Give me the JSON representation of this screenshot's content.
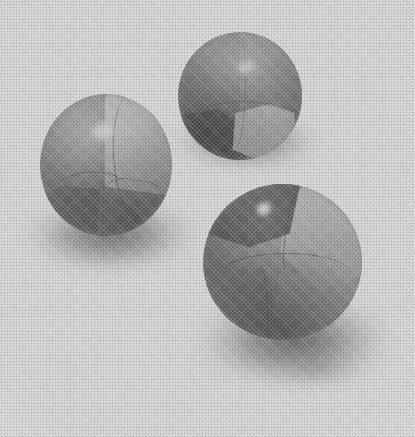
{
  "image": {
    "subject": "Three juggling balls",
    "medium": "Halftone-printed grayscale photograph",
    "background_color": "#ffffff",
    "object_count": 3,
    "alt_text": "Three round stitched-panel juggling balls on a white surface with soft shadows"
  },
  "palette": {
    "background": "#ffffff",
    "panel_light": "#d6d6d6",
    "panel_white": "#eeeeee",
    "panel_medium": "#9a9a9a",
    "panel_dark": "#6c6c6c",
    "panel_darkest": "#565656",
    "seam": "#5e5e5e",
    "highlight": "#ffffff",
    "shadow": "#6e6e6e"
  },
  "balls": [
    {
      "id": "ball-left",
      "label": "left-ball",
      "position": "left",
      "bounds": {
        "x": 40,
        "y": 94,
        "width": 132,
        "height": 142
      },
      "panels": [
        {
          "name": "upper-left-main",
          "tone": "medium",
          "color": "#a4a4a4"
        },
        {
          "name": "right-light",
          "tone": "light",
          "color": "#d2d2d2"
        },
        {
          "name": "lower-left-wedge",
          "tone": "dark",
          "color": "#7c7c7c"
        },
        {
          "name": "lower-right-foot",
          "tone": "dark",
          "color": "#868686"
        }
      ],
      "seams": [
        "vertical-curved",
        "lower-diagonal",
        "foot-diagonal"
      ],
      "highlight": {
        "name": "specular-highlight",
        "x": 36,
        "y": 18
      }
    },
    {
      "id": "ball-top",
      "label": "top-ball",
      "position": "top-center",
      "bounds": {
        "x": 178,
        "y": 32,
        "width": 124,
        "height": 128
      },
      "panels": [
        {
          "name": "upper-left-main",
          "tone": "medium-dark",
          "color": "#9c9c9c"
        },
        {
          "name": "upper-right",
          "tone": "medium",
          "color": "#a6a6a6"
        },
        {
          "name": "lower-right-white",
          "tone": "white",
          "color": "#e4e4e4"
        },
        {
          "name": "lower-left-shaded",
          "tone": "dark",
          "color": "#6d6d6d"
        }
      ],
      "seams": [
        "vertical-stitched",
        "horizontal-curved"
      ],
      "highlight": {
        "name": "specular-highlight",
        "x": 45,
        "y": 20
      }
    },
    {
      "id": "ball-right",
      "label": "bottom-right-ball",
      "position": "bottom-right",
      "bounds": {
        "x": 203,
        "y": 184,
        "width": 159,
        "height": 156
      },
      "panels": [
        {
          "name": "upper-left-dark",
          "tone": "darkest",
          "color": "#636363"
        },
        {
          "name": "upper-right-light",
          "tone": "light",
          "color": "#c9c9c9"
        },
        {
          "name": "lower-left-medium",
          "tone": "medium",
          "color": "#8a8a8a"
        },
        {
          "name": "lower-right-medium-light",
          "tone": "medium-light",
          "color": "#a2a2a2"
        }
      ],
      "seams": [
        "vertical-curved",
        "horizontal-curved",
        "lower-vertical"
      ],
      "highlight": {
        "name": "specular-highlight",
        "x": 32,
        "y": 10
      }
    }
  ],
  "shadows": [
    {
      "id": "shadow-left",
      "belongs_to": "ball-left",
      "x": 16,
      "y": 196,
      "width": 190,
      "height": 86
    },
    {
      "id": "shadow-top",
      "belongs_to": "ball-top",
      "x": 162,
      "y": 108,
      "width": 168,
      "height": 70
    },
    {
      "id": "shadow-right",
      "belongs_to": "ball-right",
      "x": 186,
      "y": 292,
      "width": 215,
      "height": 108
    },
    {
      "id": "shadow-right-tail",
      "belongs_to": "ball-right",
      "x": 268,
      "y": 352,
      "width": 120,
      "height": 42
    }
  ],
  "print_effects": {
    "halftone": "dot-screen",
    "halftone_cell_px": 3,
    "halftone_opacity": 0.3,
    "grain_opacity": 0.22
  }
}
